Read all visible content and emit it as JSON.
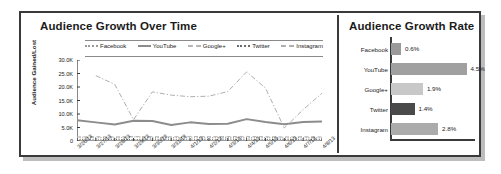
{
  "line_panel": {
    "title": "Audience Growth Over Time",
    "ylabel": "Audience Gained/Lost",
    "yticks": [
      "30.0K",
      "25.0K",
      "20.0K",
      "15.0K",
      "10.0K",
      "5.0K",
      "0"
    ],
    "legend": [
      {
        "label": "Facebook",
        "style": "dotted",
        "color": "#9a9a9a"
      },
      {
        "label": "YouTube",
        "style": "solid",
        "color": "#8c8c8c"
      },
      {
        "label": "Google+",
        "style": "dashed",
        "color": "#b5b5b5"
      },
      {
        "label": "Twitter",
        "style": "dotted",
        "color": "#6a6a6a"
      },
      {
        "label": "Instagram",
        "style": "dashdot",
        "color": "#aeaeae"
      }
    ]
  },
  "bar_panel": {
    "title": "Audience Growth Rate"
  },
  "chart_data": [
    {
      "type": "line",
      "title": "Audience Growth Over Time",
      "xlabel": "",
      "ylabel": "Audience Gained/Lost",
      "ylim": [
        0,
        30000
      ],
      "yticks": [
        0,
        5000,
        10000,
        15000,
        20000,
        25000,
        30000
      ],
      "ytick_labels": [
        "0",
        "5.0K",
        "10.0K",
        "15.0K",
        "20.0K",
        "25.0K",
        "30.0K"
      ],
      "grid": false,
      "legend_position": "top",
      "x": [
        "3/26/13",
        "3/27/13",
        "3/28/13",
        "3/29/13",
        "3/30/13",
        "3/31/13",
        "4/1/13",
        "4/2/13",
        "4/3/13",
        "4/4/13",
        "4/5/13",
        "4/6/13",
        "4/7/13",
        "4/8/13"
      ],
      "series": [
        {
          "name": "Facebook",
          "style": "dotted",
          "color": "#9a9a9a",
          "values": [
            1400,
            1300,
            1200,
            1500,
            1300,
            1250,
            1400,
            1300,
            1350,
            1250,
            1300,
            1200,
            1300,
            1200
          ]
        },
        {
          "name": "YouTube",
          "style": "solid",
          "color": "#8c8c8c",
          "values": [
            7700,
            6900,
            6100,
            7500,
            7400,
            5900,
            6900,
            6300,
            6400,
            8100,
            7000,
            6200,
            7000,
            7200
          ]
        },
        {
          "name": "Google+",
          "style": "dashed",
          "color": "#b5b5b5",
          "values": [
            1500,
            1600,
            1500,
            1700,
            1600,
            1550,
            1700,
            1600,
            1650,
            1700,
            1600,
            1500,
            1600,
            1500
          ]
        },
        {
          "name": "Twitter",
          "style": "dotted",
          "color": "#6a6a6a",
          "values": [
            600,
            650,
            600,
            550,
            700,
            620,
            650,
            600,
            700,
            650,
            600,
            580,
            650,
            600
          ]
        },
        {
          "name": "Instagram",
          "style": "dashdot",
          "color": "#aeaeae",
          "values": [
            null,
            24200,
            21000,
            7900,
            18200,
            17000,
            16400,
            16600,
            18300,
            25600,
            19600,
            4800,
            11600,
            17700
          ]
        }
      ]
    },
    {
      "type": "bar",
      "orientation": "horizontal",
      "title": "Audience Growth Rate",
      "xlabel": "",
      "ylabel": "",
      "xlim": [
        0,
        5
      ],
      "grid": false,
      "categories": [
        "Facebook",
        "YouTube",
        "Google+",
        "Twitter",
        "Instagram"
      ],
      "values": [
        0.6,
        4.5,
        1.9,
        1.4,
        2.8
      ],
      "value_labels": [
        "0.6%",
        "4.5%",
        "1.9%",
        "1.4%",
        "2.8%"
      ],
      "colors": [
        "#9a9a9a",
        "#a0a0a0",
        "#c8c8c8",
        "#4a4a4a",
        "#ababab"
      ]
    }
  ]
}
